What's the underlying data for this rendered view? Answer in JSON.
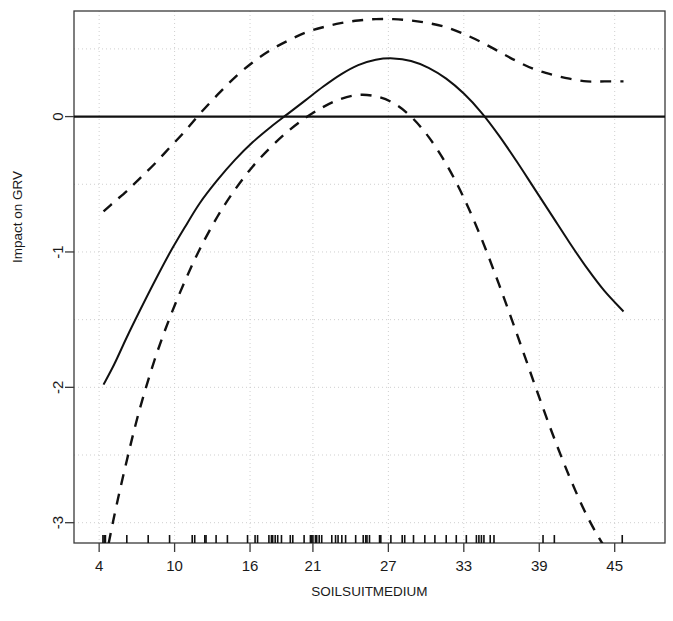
{
  "chart_data": {
    "type": "line",
    "title": "",
    "xlabel": "SOILSUITMEDIUM",
    "ylabel": "Impact on GRV",
    "xlim": [
      2.0,
      49.0
    ],
    "ylim": [
      -3.15,
      0.78
    ],
    "grid": true,
    "grid_style": "dotted",
    "legend_position": "none",
    "xticks": [
      4,
      10,
      16,
      21,
      27,
      33,
      39,
      45
    ],
    "xtick_labels": [
      "4",
      "10",
      "16",
      "21",
      "27",
      "33",
      "39",
      "45"
    ],
    "yticks": [
      0,
      -1,
      -2,
      -3
    ],
    "ytick_labels": [
      "0",
      "-1",
      "-2",
      "-3"
    ],
    "reference_line": {
      "y": 0,
      "style": "solid",
      "color": "#111111"
    },
    "rug_axis": "x",
    "rug_values": [
      4.3,
      4.4,
      4.5,
      6.2,
      7.9,
      9.6,
      11.4,
      11.6,
      12.4,
      12.5,
      13.3,
      14.2,
      15.8,
      16.4,
      16.6,
      17.5,
      17.7,
      17.8,
      18.0,
      18.2,
      18.5,
      19.2,
      19.4,
      20.3,
      20.8,
      20.9,
      21.0,
      21.2,
      21.3,
      21.5,
      21.7,
      22.5,
      22.8,
      23.0,
      23.3,
      23.6,
      24.4,
      25.0,
      25.2,
      25.3,
      25.5,
      26.3,
      26.4,
      27.2,
      28.1,
      28.3,
      29.0,
      29.9,
      30.7,
      31.6,
      32.4,
      33.2,
      34.0,
      34.2,
      34.4,
      34.6,
      35.1,
      35.4,
      39.3,
      40.2,
      45.6
    ],
    "series": [
      {
        "name": "fit",
        "style": "solid",
        "color": "#111111",
        "width": 2.0,
        "points": [
          [
            4.35,
            -1.98
          ],
          [
            5.2,
            -1.83
          ],
          [
            6.2,
            -1.63
          ],
          [
            7.2,
            -1.44
          ],
          [
            8.4,
            -1.22
          ],
          [
            9.6,
            -1.01
          ],
          [
            10.8,
            -0.82
          ],
          [
            12.0,
            -0.64
          ],
          [
            13.4,
            -0.47
          ],
          [
            14.8,
            -0.32
          ],
          [
            16.2,
            -0.19
          ],
          [
            17.6,
            -0.08
          ],
          [
            19.0,
            0.02
          ],
          [
            20.4,
            0.12
          ],
          [
            21.8,
            0.22
          ],
          [
            23.2,
            0.31
          ],
          [
            24.6,
            0.38
          ],
          [
            26.0,
            0.42
          ],
          [
            27.4,
            0.43
          ],
          [
            28.8,
            0.41
          ],
          [
            30.2,
            0.36
          ],
          [
            31.6,
            0.28
          ],
          [
            33.0,
            0.17
          ],
          [
            34.4,
            0.03
          ],
          [
            35.8,
            -0.14
          ],
          [
            37.2,
            -0.33
          ],
          [
            38.6,
            -0.53
          ],
          [
            40.0,
            -0.73
          ],
          [
            41.4,
            -0.93
          ],
          [
            42.8,
            -1.12
          ],
          [
            44.2,
            -1.29
          ],
          [
            45.7,
            -1.44
          ]
        ]
      },
      {
        "name": "upper-confidence-band",
        "style": "dashed",
        "color": "#111111",
        "width": 2.4,
        "points": [
          [
            4.35,
            -0.7
          ],
          [
            5.2,
            -0.63
          ],
          [
            6.2,
            -0.55
          ],
          [
            7.2,
            -0.46
          ],
          [
            8.4,
            -0.35
          ],
          [
            9.6,
            -0.23
          ],
          [
            10.8,
            -0.11
          ],
          [
            12.0,
            0.02
          ],
          [
            13.4,
            0.16
          ],
          [
            14.8,
            0.29
          ],
          [
            16.2,
            0.4
          ],
          [
            17.6,
            0.49
          ],
          [
            19.0,
            0.56
          ],
          [
            20.4,
            0.62
          ],
          [
            21.8,
            0.66
          ],
          [
            23.2,
            0.69
          ],
          [
            24.6,
            0.71
          ],
          [
            26.0,
            0.72
          ],
          [
            27.4,
            0.72
          ],
          [
            28.8,
            0.71
          ],
          [
            30.2,
            0.69
          ],
          [
            31.6,
            0.66
          ],
          [
            33.0,
            0.61
          ],
          [
            34.4,
            0.55
          ],
          [
            35.8,
            0.48
          ],
          [
            37.2,
            0.41
          ],
          [
            38.6,
            0.35
          ],
          [
            40.0,
            0.31
          ],
          [
            41.4,
            0.28
          ],
          [
            42.8,
            0.26
          ],
          [
            44.2,
            0.26
          ],
          [
            45.7,
            0.26
          ]
        ]
      },
      {
        "name": "lower-confidence-band",
        "style": "dashed",
        "color": "#111111",
        "width": 2.4,
        "points": [
          [
            4.45,
            -3.3
          ],
          [
            5.2,
            -2.95
          ],
          [
            6.2,
            -2.54
          ],
          [
            7.2,
            -2.17
          ],
          [
            8.4,
            -1.8
          ],
          [
            9.6,
            -1.49
          ],
          [
            10.8,
            -1.22
          ],
          [
            12.0,
            -0.98
          ],
          [
            13.4,
            -0.74
          ],
          [
            14.8,
            -0.54
          ],
          [
            16.2,
            -0.37
          ],
          [
            17.6,
            -0.23
          ],
          [
            19.0,
            -0.11
          ],
          [
            20.4,
            -0.01
          ],
          [
            21.8,
            0.07
          ],
          [
            23.2,
            0.13
          ],
          [
            24.6,
            0.16
          ],
          [
            26.0,
            0.15
          ],
          [
            27.4,
            0.1
          ],
          [
            28.8,
            0.0
          ],
          [
            30.2,
            -0.15
          ],
          [
            31.6,
            -0.35
          ],
          [
            33.0,
            -0.6
          ],
          [
            34.4,
            -0.9
          ],
          [
            35.8,
            -1.24
          ],
          [
            37.2,
            -1.6
          ],
          [
            38.6,
            -1.97
          ],
          [
            40.0,
            -2.33
          ],
          [
            41.4,
            -2.66
          ],
          [
            42.8,
            -2.95
          ],
          [
            44.2,
            -3.18
          ],
          [
            45.3,
            -3.32
          ]
        ]
      }
    ]
  }
}
